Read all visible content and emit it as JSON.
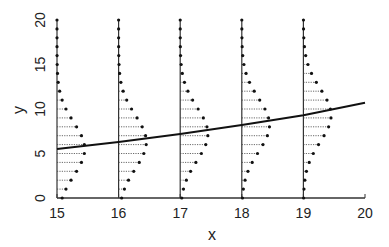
{
  "chart_data": {
    "type": "line",
    "title": "",
    "xlabel": "x",
    "ylabel": "y",
    "xlim": [
      15,
      20
    ],
    "ylim": [
      0,
      20
    ],
    "x_ticks": [
      15,
      16,
      17,
      18,
      19,
      20
    ],
    "y_ticks": [
      0,
      5,
      10,
      15,
      20
    ],
    "grid": false,
    "legend": null,
    "series": [
      {
        "name": "mean curve",
        "kind": "line",
        "x": [
          15,
          16,
          17,
          18,
          19,
          20
        ],
        "y": [
          5.5,
          6.3,
          7.2,
          8.2,
          9.3,
          10.7
        ]
      },
      {
        "name": "conditional distributions",
        "kind": "density-stems",
        "x_positions": [
          15,
          16,
          17,
          18,
          19
        ],
        "y_support": [
          0,
          1,
          2,
          3,
          4,
          5,
          6,
          7,
          8,
          9,
          10,
          11,
          12,
          13,
          14,
          15,
          16,
          17,
          18,
          19,
          20
        ],
        "centers": [
          5.5,
          6.3,
          7.2,
          8.2,
          9.3
        ],
        "sd": 3.0,
        "max_bar_length_x_units": 0.45
      }
    ]
  }
}
